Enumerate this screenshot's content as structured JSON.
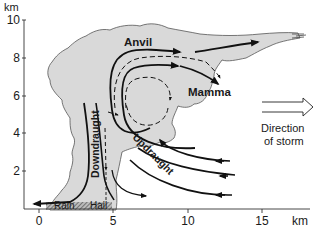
{
  "diagram": {
    "y_axis": {
      "unit": "km",
      "ticks": [
        "2",
        "4",
        "6",
        "8",
        "10"
      ]
    },
    "x_axis": {
      "unit": "km",
      "ticks": [
        "0",
        "5",
        "10",
        "15"
      ]
    },
    "labels": {
      "anvil": "Anvil",
      "mamma": "Mamma",
      "downdraught": "Downdraught",
      "updraught": "Updraught",
      "rain": "Rain",
      "hail": "Hail",
      "direction_line1": "Direction",
      "direction_line2": "of storm"
    },
    "colors": {
      "cloud_fill": "#d9d9d9",
      "cloud_outline": "#555555",
      "arrows": "#111111",
      "axis": "#333333"
    }
  }
}
